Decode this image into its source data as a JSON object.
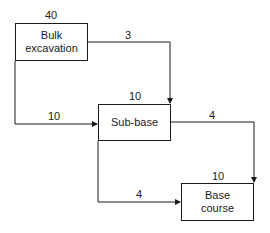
{
  "diagram": {
    "type": "precedence-network",
    "nodes": [
      {
        "id": "bulk",
        "label_line1": "Bulk",
        "label_line2": "excavation",
        "duration": "40"
      },
      {
        "id": "subbase",
        "label_line1": "Sub-base",
        "label_line2": "",
        "duration": "10"
      },
      {
        "id": "base",
        "label_line1": "Base",
        "label_line2": "course",
        "duration": "10"
      }
    ],
    "links": [
      {
        "from": "bulk",
        "to": "subbase",
        "type": "finish-to-finish",
        "lag": "3"
      },
      {
        "from": "bulk",
        "to": "subbase",
        "type": "start-to-start",
        "lag": "10"
      },
      {
        "from": "subbase",
        "to": "base",
        "type": "finish-to-finish",
        "lag": "4"
      },
      {
        "from": "subbase",
        "to": "base",
        "type": "start-to-start",
        "lag": "4"
      }
    ]
  }
}
